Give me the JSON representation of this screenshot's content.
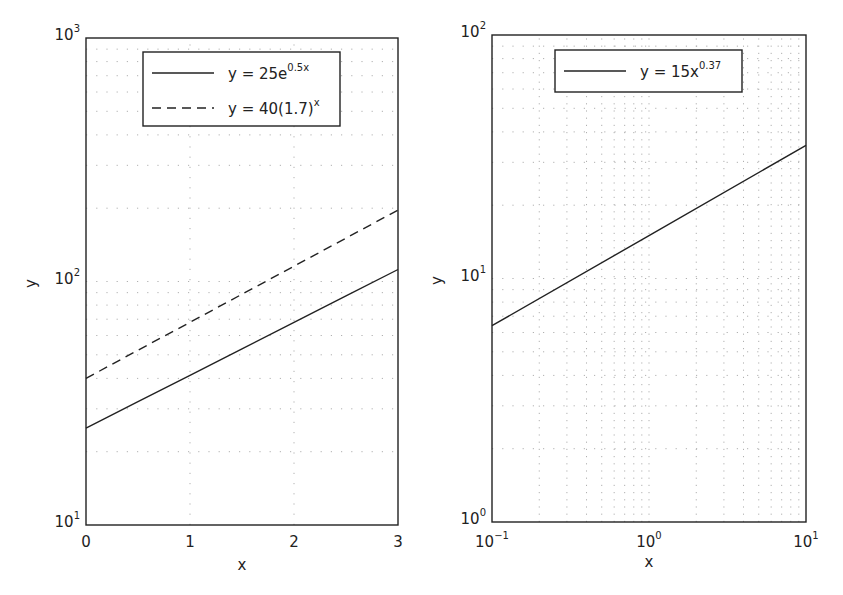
{
  "chart_data": [
    {
      "type": "line",
      "title": "",
      "xlabel": "x",
      "ylabel": "y",
      "xscale": "linear",
      "yscale": "log",
      "xlim": [
        0,
        3
      ],
      "ylim": [
        10,
        1000
      ],
      "grid": true,
      "legend_position": "upper center",
      "x_ticks": [
        "0",
        "1",
        "2",
        "3"
      ],
      "y_ticks": [
        {
          "base": "10",
          "exp": "1"
        },
        {
          "base": "10",
          "exp": "2"
        },
        {
          "base": "10",
          "exp": "3"
        }
      ],
      "series": [
        {
          "name": "y = 25e^(0.5x)",
          "label_main": "y = 25e",
          "label_sup": "0.5x",
          "style": "solid",
          "x": [
            0,
            0.5,
            1,
            1.5,
            2,
            2.5,
            3
          ],
          "values": [
            25,
            32.1,
            41.2,
            52.9,
            68.0,
            87.3,
            112.0
          ]
        },
        {
          "name": "y = 40(1.7)^x",
          "label_main": "y = 40(1.7)",
          "label_sup": "x",
          "style": "dashed",
          "x": [
            0,
            0.5,
            1,
            1.5,
            2,
            2.5,
            3
          ],
          "values": [
            40,
            52.2,
            68.0,
            88.7,
            115.6,
            150.7,
            196.5
          ]
        }
      ]
    },
    {
      "type": "line",
      "title": "",
      "xlabel": "x",
      "ylabel": "y",
      "xscale": "log",
      "yscale": "log",
      "xlim": [
        0.1,
        10
      ],
      "ylim": [
        1,
        100
      ],
      "grid": true,
      "legend_position": "upper center",
      "x_ticks": [
        {
          "base": "10",
          "exp": "−1"
        },
        {
          "base": "10",
          "exp": "0"
        },
        {
          "base": "10",
          "exp": "1"
        }
      ],
      "y_ticks": [
        {
          "base": "10",
          "exp": "0"
        },
        {
          "base": "10",
          "exp": "1"
        },
        {
          "base": "10",
          "exp": "2"
        }
      ],
      "series": [
        {
          "name": "y = 15x^0.37",
          "label_main": "y = 15x",
          "label_sup": "0.37",
          "style": "solid",
          "x": [
            0.1,
            1,
            10
          ],
          "values": [
            6.4,
            15,
            35.2
          ]
        }
      ]
    }
  ]
}
